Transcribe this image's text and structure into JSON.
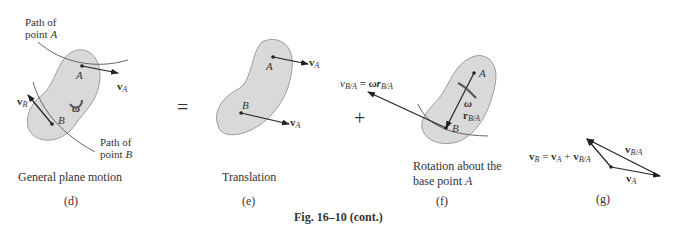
{
  "figure": {
    "caption": "Fig. 16–10 (cont.)",
    "blob_fill": "#d9d9d9",
    "blob_stroke": "#888888",
    "arrow_color": "#222222"
  },
  "panels": [
    {
      "id": "d",
      "label": "(d)",
      "title": "General plane motion",
      "annotations": {
        "path_a": [
          "Path of",
          "point A"
        ],
        "path_b": [
          "Path of",
          "point B"
        ],
        "point_a": "A",
        "point_b": "B",
        "vel_a": "v",
        "vel_a_sub": "A",
        "vel_b": "v",
        "vel_b_sub": "B",
        "omega": "ω"
      }
    },
    {
      "id": "e",
      "label": "(e)",
      "title": "Translation",
      "annotations": {
        "point_a": "A",
        "point_b": "B",
        "vel_a": "v",
        "vel_a_sub": "A",
        "vel_b": "v",
        "vel_b_sub": "A"
      }
    },
    {
      "id": "f",
      "label": "(f)",
      "title": [
        "Rotation about the",
        "base point A"
      ],
      "annotations": {
        "point_a": "A",
        "point_b": "B",
        "omega": "ω",
        "r_vec": "r",
        "r_sub": "B/A",
        "rel_vel_eq": "v",
        "rel_vel_sub": "B/A",
        "rel_vel_rhs": "= ωr",
        "rel_vel_rhs_sub": "B/A"
      }
    },
    {
      "id": "g",
      "label": "(g)",
      "equation": {
        "lhs": "v",
        "lhs_sub": "B",
        "eq": " = ",
        "t1": "v",
        "t1_sub": "A",
        "plus": " + ",
        "t2": "v",
        "t2_sub": "B/A"
      },
      "annotations": {
        "vel_rel": "v",
        "vel_rel_sub": "B/A",
        "vel_a": "v",
        "vel_a_sub": "A"
      }
    }
  ],
  "operators": {
    "equals": "=",
    "plus": "+"
  }
}
